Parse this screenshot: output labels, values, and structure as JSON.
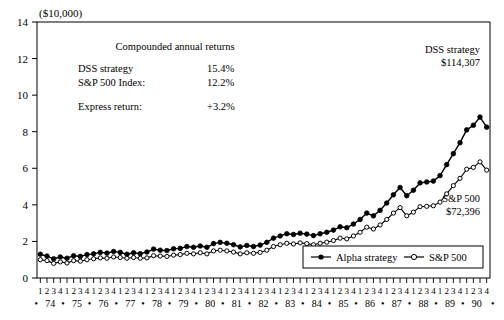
{
  "chart_data": {
    "type": "line",
    "title": "",
    "unit_label": "($10,000)",
    "xlabel": "",
    "ylabel": "",
    "ylim": [
      0,
      14
    ],
    "yticks": [
      0,
      2,
      4,
      6,
      8,
      10,
      12,
      14
    ],
    "grid": false,
    "legend_position": "bottom-right",
    "quarter_labels": [
      "1",
      "2",
      "3",
      "4"
    ],
    "years": [
      "74",
      "75",
      "76",
      "77",
      "78",
      "79",
      "80",
      "81",
      "82",
      "83",
      "84",
      "85",
      "86",
      "87",
      "88",
      "89",
      "90"
    ],
    "x": [
      "74Q1",
      "74Q2",
      "74Q3",
      "74Q4",
      "75Q1",
      "75Q2",
      "75Q3",
      "75Q4",
      "76Q1",
      "76Q2",
      "76Q3",
      "76Q4",
      "77Q1",
      "77Q2",
      "77Q3",
      "77Q4",
      "78Q1",
      "78Q2",
      "78Q3",
      "78Q4",
      "79Q1",
      "79Q2",
      "79Q3",
      "79Q4",
      "80Q1",
      "80Q2",
      "80Q3",
      "80Q4",
      "81Q1",
      "81Q2",
      "81Q3",
      "81Q4",
      "82Q1",
      "82Q2",
      "82Q3",
      "82Q4",
      "83Q1",
      "83Q2",
      "83Q3",
      "83Q4",
      "84Q1",
      "84Q2",
      "84Q3",
      "84Q4",
      "85Q1",
      "85Q2",
      "85Q3",
      "85Q4",
      "86Q1",
      "86Q2",
      "86Q3",
      "86Q4",
      "87Q1",
      "87Q2",
      "87Q3",
      "87Q4",
      "88Q1",
      "88Q2",
      "88Q3",
      "88Q4",
      "89Q1",
      "89Q2",
      "89Q3",
      "89Q4",
      "90Q1",
      "90Q2",
      "90Q3",
      "90Q4"
    ],
    "series": [
      {
        "name": "Alpha strategy",
        "marker": "filled-circle",
        "values": [
          1.3,
          1.2,
          1.05,
          1.15,
          1.08,
          1.22,
          1.18,
          1.28,
          1.32,
          1.4,
          1.36,
          1.45,
          1.4,
          1.3,
          1.38,
          1.33,
          1.42,
          1.58,
          1.52,
          1.5,
          1.6,
          1.62,
          1.72,
          1.68,
          1.75,
          1.68,
          1.88,
          1.95,
          1.9,
          1.82,
          1.7,
          1.78,
          1.72,
          1.8,
          1.95,
          2.18,
          2.3,
          2.42,
          2.38,
          2.45,
          2.4,
          2.32,
          2.42,
          2.5,
          2.62,
          2.8,
          2.75,
          2.95,
          3.2,
          3.55,
          3.4,
          3.7,
          4.1,
          4.55,
          4.95,
          4.5,
          4.8,
          5.2,
          5.25,
          5.3,
          5.6,
          6.2,
          6.8,
          7.4,
          8.1,
          8.35,
          8.8,
          8.25
        ]
      },
      {
        "name": "S&P 500",
        "marker": "open-circle",
        "values": [
          1.0,
          0.95,
          0.8,
          0.88,
          0.82,
          0.95,
          0.92,
          1.0,
          1.05,
          1.1,
          1.08,
          1.15,
          1.12,
          1.08,
          1.12,
          1.08,
          1.1,
          1.22,
          1.2,
          1.18,
          1.25,
          1.28,
          1.35,
          1.32,
          1.38,
          1.32,
          1.48,
          1.52,
          1.48,
          1.42,
          1.32,
          1.38,
          1.35,
          1.4,
          1.52,
          1.72,
          1.82,
          1.9,
          1.86,
          1.92,
          1.88,
          1.82,
          1.9,
          1.96,
          2.05,
          2.18,
          2.14,
          2.3,
          2.5,
          2.78,
          2.68,
          2.9,
          3.2,
          3.55,
          3.85,
          3.4,
          3.6,
          3.9,
          3.92,
          3.95,
          4.15,
          4.6,
          5.05,
          5.45,
          5.95,
          6.05,
          6.35,
          5.9
        ]
      }
    ],
    "annotations": [
      {
        "id": "dss-annotation",
        "lines": [
          "DSS strategy",
          "$114,307"
        ]
      },
      {
        "id": "sp500-annotation",
        "lines": [
          "S&P 500",
          "$72,396"
        ]
      }
    ],
    "stats_box": {
      "title": "Compounded annual returns",
      "rows": [
        {
          "label": "DSS strategy",
          "value": "15.4%"
        },
        {
          "label": "S&P 500 Index:",
          "value": "12.2%"
        },
        {
          "label": "Express return:",
          "value": "+3.2%"
        }
      ]
    },
    "legend": [
      {
        "label": "Alpha strategy",
        "marker": "filled-circle"
      },
      {
        "label": "S&P 500",
        "marker": "open-circle"
      }
    ],
    "colors": {
      "line": "#000000",
      "axis": "#000000",
      "background": "#ffffff",
      "marker_fill_open": "#ffffff"
    }
  }
}
